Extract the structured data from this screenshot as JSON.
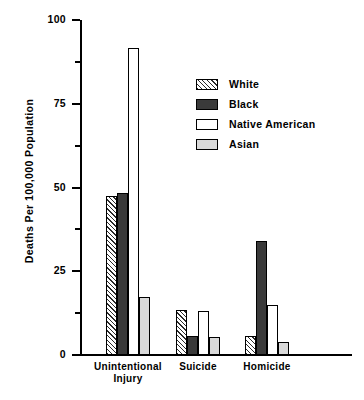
{
  "chart_data": {
    "type": "bar",
    "title": "",
    "xlabel": "",
    "ylabel": "Deaths Per 100,000 Population",
    "ylim": [
      0,
      100
    ],
    "yticks": [
      0,
      25,
      50,
      75,
      100
    ],
    "ytick_labels": [
      "0",
      "25",
      "50",
      "75",
      "100"
    ],
    "yminor_ticks": [
      12.5,
      37.5,
      62.5,
      87.5
    ],
    "grid": false,
    "legend_position": "upper right",
    "categories": [
      "Unintentional Injury",
      "Suicide",
      "Homicide"
    ],
    "category_label_lines": [
      [
        "Unintentional",
        "Injury"
      ],
      [
        "Suicide"
      ],
      [
        "Homicide"
      ]
    ],
    "series": [
      {
        "name": "White",
        "pattern": "diagonal-hatch",
        "color": "#ffffff",
        "values": [
          47.5,
          13.4,
          5.7
        ]
      },
      {
        "name": "Black",
        "pattern": "solid-dark",
        "color": "#3a3a3a",
        "values": [
          48.5,
          5.7,
          34.0
        ]
      },
      {
        "name": "Native American",
        "pattern": "empty",
        "color": "#ffffff",
        "values": [
          91.6,
          13.1,
          14.9
        ]
      },
      {
        "name": "Asian",
        "pattern": "light-gray",
        "color": "#d9d9d9",
        "values": [
          17.3,
          5.4,
          3.9
        ]
      }
    ]
  },
  "legend": {
    "items": [
      {
        "label": "White"
      },
      {
        "label": "Black"
      },
      {
        "label": "Native American"
      },
      {
        "label": "Asian"
      }
    ]
  },
  "axis": {
    "y_title": "Deaths Per 100,000 Population",
    "y_labels": [
      "100",
      "75",
      "50",
      "25",
      "0"
    ]
  }
}
